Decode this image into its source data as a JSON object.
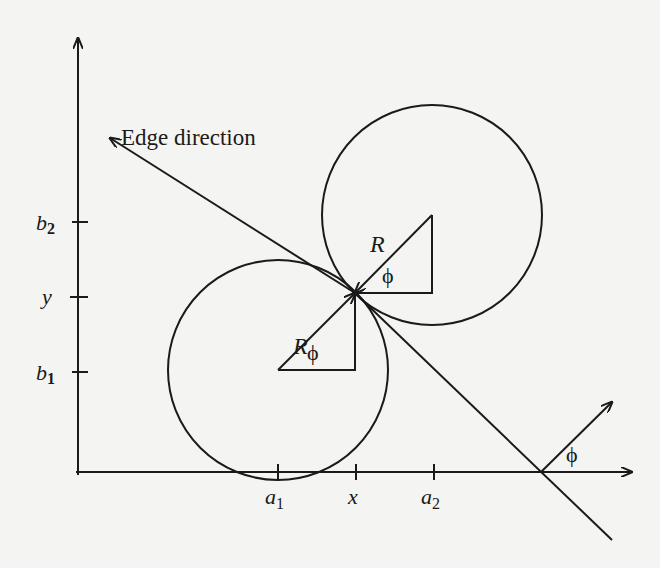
{
  "figure": {
    "annotation": "Edge direction",
    "y_axis_ticks": [
      {
        "base": "b",
        "sub": "2",
        "y": 222
      },
      {
        "base": "y",
        "sub": "",
        "y": 297
      },
      {
        "base": "b",
        "sub": "1",
        "y": 372
      }
    ],
    "x_axis_ticks": [
      {
        "base": "a",
        "sub": "1",
        "x": 278
      },
      {
        "base": "x",
        "sub": "",
        "x": 356
      },
      {
        "base": "a",
        "sub": "2",
        "x": 434
      }
    ],
    "radius_label": "R",
    "angle_label": "ϕ",
    "colors": {
      "ink": "#1a1a1a",
      "paper": "#f4f4f2"
    }
  }
}
